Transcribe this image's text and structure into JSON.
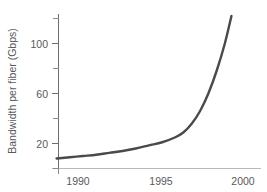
{
  "chart_data": {
    "type": "line",
    "title": "",
    "xlabel": "",
    "ylabel": "Bandwidth per fiber (Gbps)",
    "xlim": [
      1988.6,
      2000.6
    ],
    "ylim": [
      0,
      128
    ],
    "grid": false,
    "legend": null,
    "xticks": [
      1990,
      1995,
      2000
    ],
    "xticklabels": [
      "1990",
      "1995",
      "2000"
    ],
    "yticks": [
      20,
      60,
      100
    ],
    "yticklabels": [
      "20",
      "60",
      "100"
    ],
    "yticks_minor": [
      0,
      40,
      80,
      120
    ],
    "series": [
      {
        "name": "Bandwidth per fiber",
        "color": "#4a4a4a",
        "x": [
          1988.7,
          1989.5,
          1990.3,
          1991.1,
          1991.9,
          1992.7,
          1993.5,
          1994.3,
          1995.1,
          1995.9,
          1996.4,
          1996.9,
          1997.4,
          1997.9,
          1998.4,
          1998.9,
          1999.3
        ],
        "y": [
          8,
          9,
          10,
          11,
          12.5,
          14,
          16,
          18.5,
          21,
          25,
          29,
          36,
          46,
          60,
          78,
          100,
          122
        ]
      }
    ],
    "annotations": []
  },
  "axis": {
    "y_title": "Bandwidth per fiber (Gbps)",
    "tick_20": "20",
    "tick_60": "60",
    "tick_100": "100",
    "tick_1990": "1990",
    "tick_1995": "1995",
    "tick_2000": "2000"
  },
  "colors": {
    "curve": "#4a4a4a",
    "axis": "#6e6e6e",
    "baseline": "#b9b9b9",
    "text": "#58595b",
    "background": "#ffffff"
  }
}
